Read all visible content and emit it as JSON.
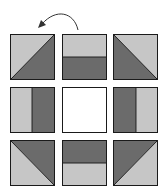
{
  "diagram": {
    "colors": {
      "light": "#c6c6c6",
      "dark": "#6b6b6b",
      "center": "#ffffff",
      "border": "#1a1a1a"
    },
    "rotation_arrow": {
      "direction": "counter-clockwise"
    },
    "tiles": [
      {
        "row": 0,
        "col": 0,
        "type": "half-square-triangle",
        "light": "top-left",
        "dark": "bottom-right"
      },
      {
        "row": 0,
        "col": 1,
        "type": "two-strip",
        "light": "top",
        "dark": "bottom"
      },
      {
        "row": 0,
        "col": 2,
        "type": "half-square-triangle",
        "light": "top-right",
        "dark": "bottom-left"
      },
      {
        "row": 1,
        "col": 0,
        "type": "two-strip",
        "light": "left",
        "dark": "right"
      },
      {
        "row": 1,
        "col": 1,
        "type": "plain",
        "fill": "white"
      },
      {
        "row": 1,
        "col": 2,
        "type": "two-strip",
        "light": "right",
        "dark": "left"
      },
      {
        "row": 2,
        "col": 0,
        "type": "half-square-triangle",
        "light": "bottom-left",
        "dark": "top-right"
      },
      {
        "row": 2,
        "col": 1,
        "type": "two-strip",
        "light": "bottom",
        "dark": "top"
      },
      {
        "row": 2,
        "col": 2,
        "type": "half-square-triangle",
        "light": "bottom-right",
        "dark": "top-left"
      }
    ]
  }
}
